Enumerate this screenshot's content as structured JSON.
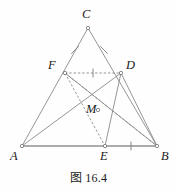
{
  "figure": {
    "caption": "图 16.4",
    "caption_number": "16.4",
    "stroke_color": "#8a8a8a",
    "baseline_color": "#8f8f8f",
    "label_color": "#1a1a1a",
    "background": "#fefefe",
    "width": 177,
    "height": 190,
    "vertices": [
      {
        "id": "C",
        "label": "C",
        "x": 88,
        "y": 28,
        "label_x": 82,
        "label_y": 8
      },
      {
        "id": "F",
        "label": "F",
        "x": 65,
        "y": 73,
        "label_x": 48,
        "label_y": 59
      },
      {
        "id": "D",
        "label": "D",
        "x": 121,
        "y": 73,
        "label_x": 126,
        "label_y": 59
      },
      {
        "id": "M",
        "label": "M",
        "x": 98,
        "y": 110,
        "label_x": 89,
        "label_y": 110
      },
      {
        "id": "A",
        "label": "A",
        "x": 22,
        "y": 146,
        "label_x": 11,
        "label_y": 150
      },
      {
        "id": "E",
        "label": "E",
        "x": 105,
        "y": 146,
        "label_x": 100,
        "label_y": 150
      },
      {
        "id": "B",
        "label": "B",
        "x": 157,
        "y": 146,
        "label_x": 162,
        "label_y": 150
      }
    ],
    "solid_segments": [
      {
        "name": "segment-CA",
        "from": "C",
        "to": "A"
      },
      {
        "name": "segment-CB",
        "from": "C",
        "to": "B"
      },
      {
        "name": "segment-AB",
        "from": "A",
        "to": "B"
      },
      {
        "name": "segment-AD",
        "from": "A",
        "to": "D"
      },
      {
        "name": "segment-DE",
        "from": "D",
        "to": "E"
      },
      {
        "name": "segment-DB",
        "from": "D",
        "to": "B"
      },
      {
        "name": "segment-FB",
        "from": "F",
        "to": "B"
      }
    ],
    "dashed_segments": [
      {
        "name": "segment-FD",
        "from": "F",
        "to": "D"
      },
      {
        "name": "segment-FE",
        "from": "F",
        "to": "E"
      },
      {
        "name": "segment-FM-extended",
        "from": "F",
        "to": "B"
      }
    ],
    "tick_marks": [
      {
        "name": "tick-CF",
        "on": "segment-CF",
        "x": 75,
        "y": 50,
        "angle": 63
      },
      {
        "name": "tick-CD",
        "on": "segment-CD",
        "x": 104,
        "y": 50,
        "angle": 117
      },
      {
        "name": "tick-FD",
        "on": "segment-FD",
        "x": 93,
        "y": 73,
        "angle": 90
      },
      {
        "name": "tick-EB",
        "on": "segment-EB",
        "x": 131,
        "y": 146,
        "angle": 90
      }
    ]
  }
}
